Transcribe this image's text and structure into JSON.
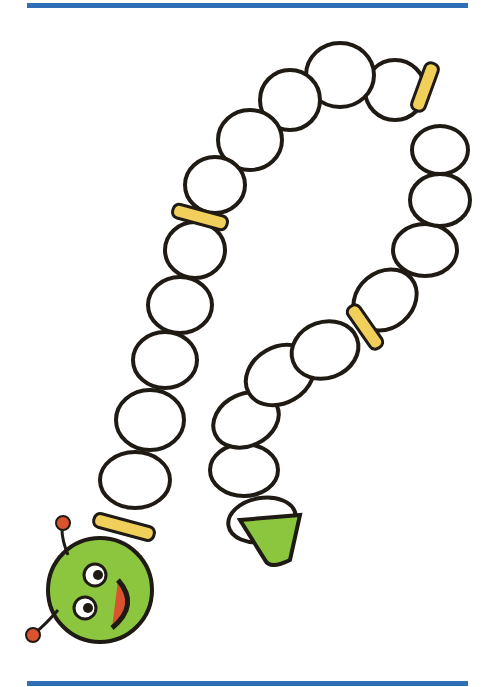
{
  "image": {
    "subject": "caterpillar drawing",
    "colors": {
      "border": "#2e6fb8",
      "body": "#ffffff",
      "outline": "#1f1a14",
      "band": "#f0cf5a",
      "head": "#8cc63f",
      "nose": "#d9532f"
    }
  }
}
